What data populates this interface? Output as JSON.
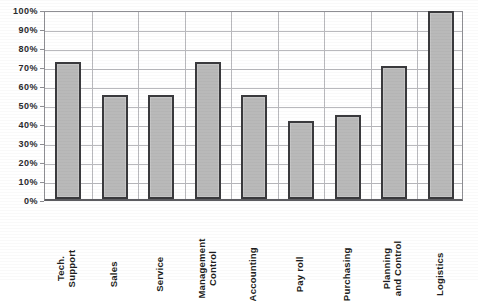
{
  "chart_data": {
    "type": "bar",
    "title": "",
    "title_cutoff_note": "",
    "xlabel": "",
    "ylabel": "",
    "ylim": [
      0,
      100
    ],
    "ytick_labels": [
      "100%",
      "90%",
      "80%",
      "70%",
      "60%",
      "50%",
      "40%",
      "30%",
      "20%",
      "10%",
      "0%"
    ],
    "ytick_values": [
      100,
      90,
      80,
      70,
      60,
      50,
      40,
      30,
      20,
      10,
      0
    ],
    "grid": "horizontal-and-vertical",
    "legend": "none",
    "categories": [
      "Tech. Support",
      "Sales",
      "Service",
      "Management Control",
      "Accounting",
      "Pay roll",
      "Purchasing",
      "Planning and Control",
      "Logistics"
    ],
    "category_label_lines": [
      [
        "Tech.",
        "Support"
      ],
      [
        "Sales"
      ],
      [
        "Service"
      ],
      [
        "Management",
        "Control"
      ],
      [
        "Accounting"
      ],
      [
        "Pay roll"
      ],
      [
        "Purchasing"
      ],
      [
        "Planning",
        "and Control"
      ],
      [
        "Logistics"
      ]
    ],
    "values": [
      72,
      55,
      55,
      72,
      55,
      41,
      44,
      70,
      99
    ],
    "value_labels": [
      "72%",
      "55%",
      "55%",
      "72%",
      "55%",
      "41%",
      "44%",
      "70%",
      "99%"
    ]
  },
  "style": {
    "bar_fill": "#b9b9b9",
    "bar_border": "#3a3a3d",
    "grid_color": "#b9b9bd",
    "axis_color": "#8e8e93",
    "text_color": "#1e1e21",
    "background": "#ffffff"
  }
}
